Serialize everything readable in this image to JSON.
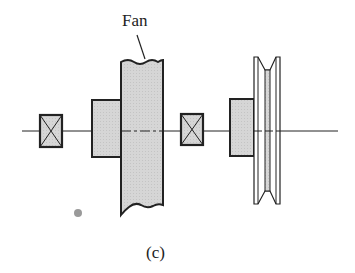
{
  "diagram": {
    "labels": {
      "fan": "Fan",
      "caption": "(c)"
    },
    "components": [
      {
        "name": "bearing-left",
        "type": "bearing"
      },
      {
        "name": "fan-hub",
        "type": "hub"
      },
      {
        "name": "fan",
        "type": "fan"
      },
      {
        "name": "bearing-right",
        "type": "bearing"
      },
      {
        "name": "pulley-hub",
        "type": "hub"
      },
      {
        "name": "v-belt-pulley",
        "type": "pulley"
      }
    ],
    "colors": {
      "fill": "#d4d4d4",
      "stroke": "#222222",
      "background": "#ffffff"
    }
  }
}
